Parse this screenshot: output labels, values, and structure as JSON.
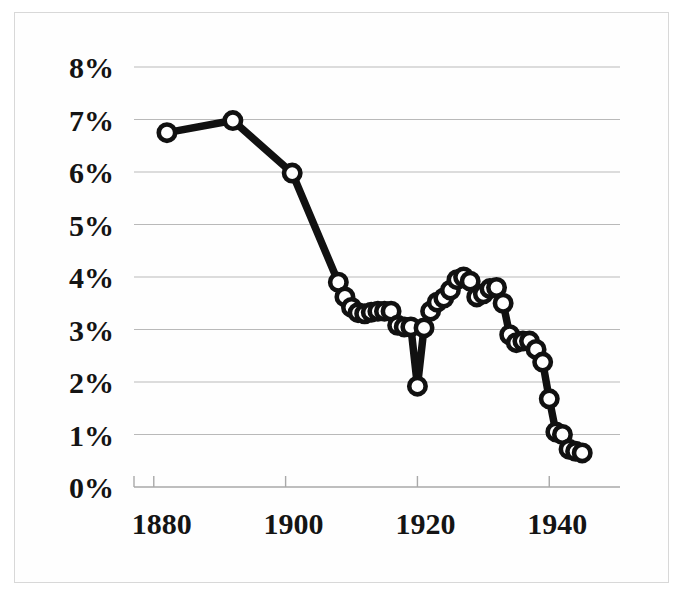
{
  "chart_data": {
    "type": "line",
    "title": "",
    "subtitle": "",
    "xlabel": "",
    "ylabel": "",
    "x": [
      1882,
      1892,
      1901,
      1908,
      1909,
      1910,
      1911,
      1912,
      1913,
      1914,
      1915,
      1916,
      1917,
      1918,
      1919,
      1920,
      1921,
      1922,
      1923,
      1924,
      1925,
      1926,
      1927,
      1928,
      1929,
      1930,
      1931,
      1932,
      1933,
      1934,
      1935,
      1936,
      1937,
      1938,
      1939,
      1940,
      1941,
      1942,
      1943,
      1944,
      1945
    ],
    "values": [
      6.75,
      6.98,
      5.98,
      3.9,
      3.62,
      3.42,
      3.32,
      3.3,
      3.33,
      3.35,
      3.35,
      3.35,
      3.08,
      3.05,
      3.05,
      1.92,
      3.03,
      3.35,
      3.52,
      3.6,
      3.75,
      3.95,
      4.0,
      3.92,
      3.62,
      3.68,
      3.78,
      3.8,
      3.5,
      2.9,
      2.75,
      2.78,
      2.78,
      2.62,
      2.38,
      1.68,
      1.05,
      1.0,
      0.72,
      0.68,
      0.65
    ],
    "xlim": [
      1877,
      1948
    ],
    "ylim": [
      0,
      8
    ],
    "ytick_values": [
      0,
      1,
      2,
      3,
      4,
      5,
      6,
      7,
      8
    ],
    "ytick_labels": [
      "0%",
      "1%",
      "2%",
      "3%",
      "4%",
      "5%",
      "6%",
      "7%",
      "8%"
    ],
    "xtick_values": [
      1880,
      1900,
      1920,
      1940
    ],
    "xtick_labels": [
      "1880",
      "1900",
      "1920",
      "1940"
    ],
    "grid": true,
    "grid_axis": "y",
    "legend": false,
    "legend_position": "none",
    "series_name": "",
    "marker": "circle-open",
    "line_color": "#111111",
    "marker_face_color": "#ffffff",
    "grid_color": "#b9b9b9",
    "axis_color": "#a9a9a9",
    "background_color": "#ffffff",
    "border_color": "#d8d8d8"
  }
}
